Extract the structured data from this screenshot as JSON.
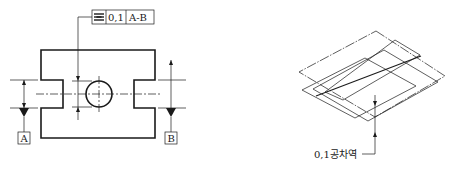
{
  "left_figure": {
    "feature_control_frame": {
      "symbol": "symmetry",
      "symbol_icon": "symmetry-icon",
      "tolerance": "0,1",
      "datum_reference": "A-B"
    },
    "datums": [
      {
        "label": "A"
      },
      {
        "label": "B"
      }
    ]
  },
  "right_figure": {
    "annotation": "0,1공차역"
  },
  "colors": {
    "line": "#1a1a1a",
    "background": "#ffffff"
  }
}
